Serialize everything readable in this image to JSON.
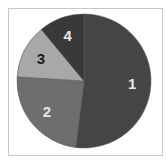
{
  "chart_data": {
    "type": "pie",
    "title": "",
    "categories": [
      "1",
      "2",
      "3",
      "4"
    ],
    "values": [
      52,
      24,
      13,
      11
    ],
    "colors": [
      "#454545",
      "#6e6e6e",
      "#a8a8a8",
      "#393939"
    ],
    "label_colors": [
      "#e6e6e6",
      "#e6e6e6",
      "#1a1a1a",
      "#e6e6e6"
    ],
    "start_angle_deg": 0,
    "direction": "clockwise",
    "legend": "none",
    "slice_labels_inside": true
  },
  "layout": {
    "center": [
      84,
      81
    ],
    "radius": 67,
    "frame_border_color": "#c8c8c8"
  }
}
